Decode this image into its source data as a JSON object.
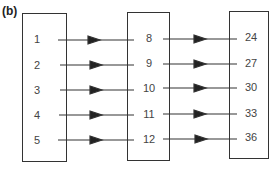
{
  "figure_label": "(b)",
  "sets": [
    {
      "name": "domain",
      "values": [
        "1",
        "2",
        "3",
        "4",
        "5"
      ]
    },
    {
      "name": "middle",
      "values": [
        "8",
        "9",
        "10",
        "11",
        "12"
      ]
    },
    {
      "name": "range",
      "values": [
        "24",
        "27",
        "30",
        "33",
        "36"
      ]
    }
  ],
  "mappings": [
    {
      "from": "1",
      "to": "8"
    },
    {
      "from": "2",
      "to": "9"
    },
    {
      "from": "3",
      "to": "10"
    },
    {
      "from": "4",
      "to": "11"
    },
    {
      "from": "5",
      "to": "12"
    },
    {
      "from": "8",
      "to": "24"
    },
    {
      "from": "9",
      "to": "27"
    },
    {
      "from": "10",
      "to": "30"
    },
    {
      "from": "11",
      "to": "33"
    },
    {
      "from": "12",
      "to": "36"
    }
  ]
}
